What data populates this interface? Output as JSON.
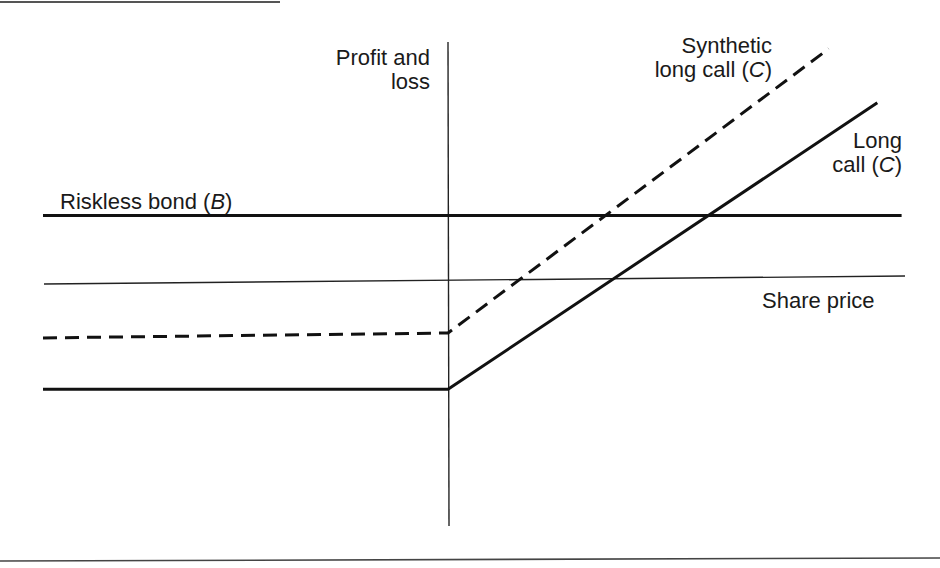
{
  "chart_data": {
    "type": "line",
    "title": "",
    "xlabel": "Share price",
    "ylabel": "Profit and loss",
    "axis_labels": {
      "y_axis_line1": "Profit and",
      "y_axis_line2": "loss",
      "x_axis": "Share price"
    },
    "x_range": [
      -1,
      1.13
    ],
    "y_range": [
      -1.2,
      1
    ],
    "series": [
      {
        "name": "Riskless bond (B)",
        "label_text": "Riskless bond (",
        "label_italic": "B",
        "label_close": ")",
        "style": "solid",
        "points": [
          [
            -1,
            0.28
          ],
          [
            1.12,
            0.28
          ]
        ]
      },
      {
        "name": "Synthetic long call (C)",
        "label_line1": "Synthetic",
        "label_line2_text": "long call (",
        "label_italic": "C",
        "label_close": ")",
        "style": "dashed",
        "points": [
          [
            -1,
            -0.22
          ],
          [
            0,
            -0.2
          ],
          [
            0.94,
            0.96
          ]
        ]
      },
      {
        "name": "Long call (C)",
        "label_line1": "Long",
        "label_line2_text": "call (",
        "label_italic": "C",
        "label_close": ")",
        "style": "solid",
        "points": [
          [
            -1,
            -0.43
          ],
          [
            0,
            -0.43
          ],
          [
            1.06,
            0.74
          ]
        ]
      }
    ]
  }
}
